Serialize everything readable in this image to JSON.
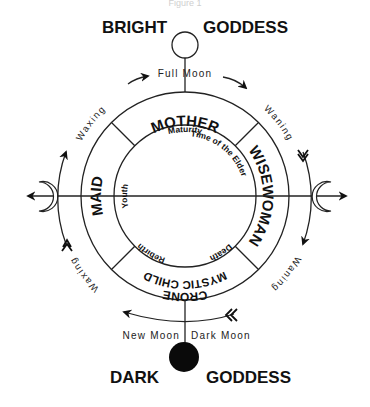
{
  "diagram": {
    "top_label_cut": "Figure 1",
    "top": {
      "left": "BRIGHT",
      "right": "GODDESS",
      "moon_label": "Full Moon",
      "moon_icon": "full-moon-circle"
    },
    "bottom": {
      "left": "DARK",
      "right": "GODDESS",
      "moon_left_label": "New Moon",
      "moon_right_label": "Dark Moon",
      "moon_icon": "dark-moon-disc"
    },
    "outer_ring": {
      "top": "MOTHER",
      "right": "WISEWOMAN",
      "bottom": "CRONE",
      "bottom_inner": "MYSTIC CHILD",
      "left": "MAID"
    },
    "inner_ring": {
      "top": "Maturity",
      "right": "Time of the Elder",
      "bottom_right": "Death",
      "bottom_left": "Rebirth",
      "left": "Youth"
    },
    "phases": {
      "upper_left": "Waxing",
      "upper_right": "Waning",
      "lower_left": "Waxing",
      "lower_right": "Waning"
    },
    "side_icons": {
      "left": "crescent-moon-waxing",
      "right": "crescent-moon-waning"
    },
    "colors": {
      "ink": "#111111",
      "background": "#ffffff"
    }
  }
}
